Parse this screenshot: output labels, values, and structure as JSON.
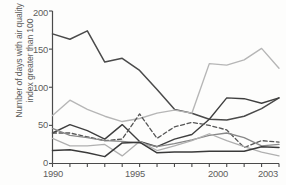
{
  "chart_data": {
    "type": "line",
    "title": "",
    "subtitle": "",
    "xlabel": "",
    "ylabel": "Number of days with air quality\nindex greater than 100",
    "x": [
      1990,
      1991,
      1992,
      1993,
      1994,
      1995,
      1996,
      1997,
      1998,
      1999,
      2000,
      2001,
      2002,
      2003
    ],
    "xlim": [
      1990,
      2003
    ],
    "ylim": [
      0,
      200
    ],
    "xticks": [
      1990,
      1991,
      1992,
      1993,
      1994,
      1995,
      1996,
      1997,
      1998,
      1999,
      2000,
      2001,
      2002,
      2003
    ],
    "xtick_labels_shown": [
      "1990",
      "1995",
      "2000",
      "2003"
    ],
    "yticks": [
      0,
      50,
      100,
      150,
      200
    ],
    "ytick_labels": [
      "0",
      "50",
      "100",
      "150",
      "200"
    ],
    "grid": false,
    "legend": "none",
    "series": [
      {
        "name": "series-1",
        "style": "solid",
        "color": "#4a4a4a",
        "width": 1.5,
        "values": [
          170,
          163,
          174,
          133,
          138,
          122,
          97,
          71,
          66,
          58,
          57,
          62,
          72,
          86
        ]
      },
      {
        "name": "series-2",
        "style": "solid",
        "color": "#3f3f3f",
        "width": 1.4,
        "values": [
          40,
          51,
          43,
          32,
          51,
          29,
          22,
          32,
          38,
          58,
          86,
          85,
          79,
          86
        ]
      },
      {
        "name": "series-3",
        "style": "solid",
        "color": "#b6b6b6",
        "width": 1.4,
        "values": [
          63,
          83,
          71,
          62,
          55,
          59,
          66,
          70,
          66,
          131,
          129,
          136,
          151,
          125
        ]
      },
      {
        "name": "series-4",
        "style": "dashed",
        "color": "#555555",
        "width": 1.3,
        "values": [
          40,
          40,
          35,
          30,
          32,
          65,
          33,
          48,
          54,
          50,
          44,
          21,
          30,
          28
        ]
      },
      {
        "name": "series-5",
        "style": "solid",
        "color": "#888888",
        "width": 1.3,
        "values": [
          46,
          37,
          34,
          30,
          29,
          27,
          22,
          26,
          31,
          37,
          40,
          34,
          23,
          25
        ]
      },
      {
        "name": "series-6",
        "style": "solid",
        "color": "#b0b0b0",
        "width": 1.3,
        "values": [
          33,
          23,
          23,
          25,
          10,
          29,
          17,
          23,
          30,
          39,
          30,
          22,
          15,
          10
        ]
      },
      {
        "name": "series-7",
        "style": "solid",
        "color": "#3a3a3a",
        "width": 1.5,
        "values": [
          17,
          18,
          14,
          9,
          27,
          28,
          14,
          15,
          15,
          16,
          16,
          16,
          22,
          21
        ]
      }
    ],
    "axis_color": "#4a4a4a",
    "background": "#fdfdfc"
  },
  "axes": {
    "ylabel_line1": "Number of days with air quality",
    "ylabel_line2": "index greater than 100",
    "ytick_0": "0",
    "ytick_50": "50",
    "ytick_100": "100",
    "ytick_150": "150",
    "ytick_200": "200",
    "xtick_1990": "1990",
    "xtick_1995": "1995",
    "xtick_2000": "2000",
    "xtick_2003": "2003"
  }
}
